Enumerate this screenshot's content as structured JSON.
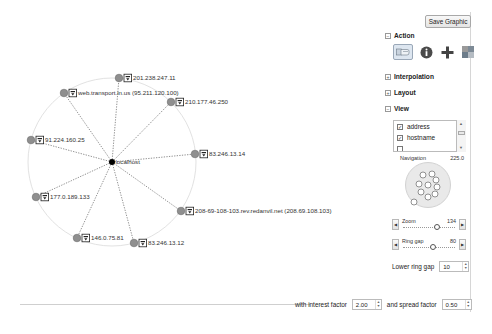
{
  "toolbar": {
    "save_label": "Save Graphic"
  },
  "sections": {
    "action": {
      "label": "Action",
      "expanded": true,
      "buttons": [
        {
          "name": "pan-tool",
          "icon": "hand-pointer-icon",
          "selected": true
        },
        {
          "name": "info-tool",
          "icon": "info-icon",
          "selected": false
        },
        {
          "name": "add-tool",
          "icon": "plus-icon",
          "selected": false
        },
        {
          "name": "color-tool",
          "icon": "palette-icon",
          "selected": false
        }
      ]
    },
    "interpolation": {
      "label": "Interpolation",
      "expanded": false
    },
    "layout": {
      "label": "Layout",
      "expanded": false
    },
    "view": {
      "label": "View",
      "expanded": true,
      "items": [
        {
          "label": "address",
          "checked": true
        },
        {
          "label": "hostname",
          "checked": true
        }
      ],
      "navigation": {
        "label": "Navigation",
        "value": "225.0"
      },
      "zoom": {
        "label": "Zoom",
        "value": "134"
      },
      "ring_gap": {
        "label": "Ring gap",
        "value": "80"
      },
      "lower_ring_gap": {
        "label": "Lower ring gap",
        "value": "10"
      }
    }
  },
  "bottom": {
    "interest_label": "with interest factor",
    "interest_value": "2.00",
    "spread_label": "and spread factor",
    "spread_value": "0.50"
  },
  "graph": {
    "center": {
      "label": "localhost"
    },
    "nodes": [
      {
        "label": "201.238.247.11"
      },
      {
        "label": "web.transport.in.us (95.211.120.100)"
      },
      {
        "label": "210.177.46.250"
      },
      {
        "label": "91.224.160.25"
      },
      {
        "label": "83.246.13.14"
      },
      {
        "label": "177.0.189.133"
      },
      {
        "label": "208-69-108-103.rev.redanvil.net (208.69.108.103)"
      },
      {
        "label": "146.0.75.81"
      },
      {
        "label": "83.246.13.12"
      }
    ]
  },
  "colors": {
    "node_fill": "#8f8f8f",
    "ring": "#dddddd",
    "center": "#000000"
  }
}
